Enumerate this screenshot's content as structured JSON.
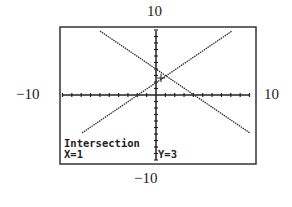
{
  "chart_data": {
    "type": "line",
    "title": "",
    "window": {
      "xmin": -10,
      "xmax": 10,
      "ymin": -10,
      "ymax": 10,
      "xscl": 1,
      "yscl": 1
    },
    "labels": {
      "ymax": "10",
      "ymin": "−10",
      "xmin": "−10",
      "xmax": "10"
    },
    "series": [
      {
        "name": "increasing line",
        "x": [
          -8,
          8
        ],
        "y": [
          -5,
          11
        ],
        "note": "y = x + 2 (approx)"
      },
      {
        "name": "decreasing line",
        "x": [
          -6,
          10
        ],
        "y": [
          7,
          -4
        ],
        "note": "y = -0.7x + 3.7 (approx)"
      }
    ],
    "intersection": {
      "x": 1,
      "y": 3
    },
    "grid": false,
    "ticks_on_axes": true
  },
  "screen": {
    "mode_label": "Intersection",
    "x_readout": "X=1",
    "y_readout": "Y=3"
  },
  "colors": {
    "ink": "#222222",
    "background": "#ffffff"
  }
}
